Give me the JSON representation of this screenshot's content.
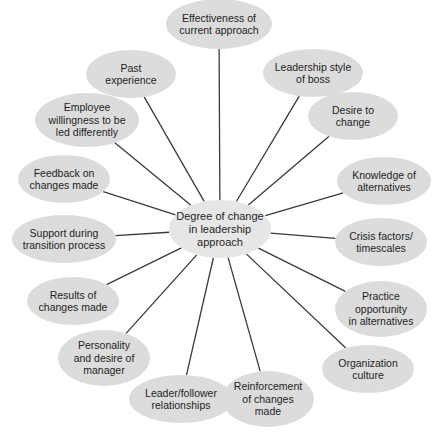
{
  "diagram": {
    "type": "radial-mind-map",
    "line_color": "#3a3a3a",
    "node_color": "#dcdcdc",
    "center": {
      "label": "Degree of change\nin leadership\napproach",
      "cx": 220,
      "cy": 229,
      "w": 102,
      "h": 58
    },
    "nodes": [
      {
        "id": "effectiveness",
        "label": "Effectiveness of\ncurrent approach",
        "cx": 219,
        "cy": 24,
        "w": 106,
        "h": 50
      },
      {
        "id": "leadership-style",
        "label": "Leadership style\nof boss",
        "cx": 313,
        "cy": 73,
        "w": 100,
        "h": 48
      },
      {
        "id": "desire-to-change",
        "label": "Desire to\nchange",
        "cx": 353,
        "cy": 116,
        "w": 90,
        "h": 48
      },
      {
        "id": "knowledge",
        "label": "Knowledge of\nalternatives",
        "cx": 384,
        "cy": 181,
        "w": 94,
        "h": 48
      },
      {
        "id": "crisis",
        "label": "Crisis factors/\ntimescales",
        "cx": 381,
        "cy": 242,
        "w": 92,
        "h": 48
      },
      {
        "id": "practice",
        "label": "Practice\nopportunity\nin alternatives",
        "cx": 381,
        "cy": 309,
        "w": 92,
        "h": 56
      },
      {
        "id": "organization",
        "label": "Organization\nculture",
        "cx": 368,
        "cy": 369,
        "w": 92,
        "h": 48
      },
      {
        "id": "reinforcement",
        "label": "Reinforcement\nof changes\nmade",
        "cx": 268,
        "cy": 399,
        "w": 92,
        "h": 56
      },
      {
        "id": "leader-follower",
        "label": "Leader/follower\nrelationships",
        "cx": 181,
        "cy": 399,
        "w": 104,
        "h": 48
      },
      {
        "id": "personality",
        "label": "Personality\nand desire of\nmanager",
        "cx": 104,
        "cy": 358,
        "w": 92,
        "h": 56
      },
      {
        "id": "results",
        "label": "Results of\nchanges made",
        "cx": 73,
        "cy": 301,
        "w": 92,
        "h": 48
      },
      {
        "id": "support",
        "label": "Support during\ntransition process",
        "cx": 64,
        "cy": 239,
        "w": 104,
        "h": 48
      },
      {
        "id": "feedback",
        "label": "Feedback on\nchanges made",
        "cx": 64,
        "cy": 179,
        "w": 92,
        "h": 48
      },
      {
        "id": "employee-willingness",
        "label": "Employee\nwillingness to be\nled differently",
        "cx": 87,
        "cy": 120,
        "w": 104,
        "h": 54
      },
      {
        "id": "past-experience",
        "label": "Past\nexperience",
        "cx": 131,
        "cy": 74,
        "w": 90,
        "h": 48
      }
    ]
  }
}
